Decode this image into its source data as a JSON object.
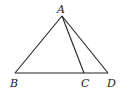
{
  "diagram": {
    "type": "triangle",
    "points": {
      "A": {
        "label": "A",
        "x": 62,
        "y": 16
      },
      "B": {
        "label": "B",
        "x": 15,
        "y": 73
      },
      "C": {
        "label": "C",
        "x": 84,
        "y": 73
      },
      "D": {
        "label": "D",
        "x": 108,
        "y": 73
      }
    },
    "segments": [
      [
        "A",
        "B"
      ],
      [
        "A",
        "C"
      ],
      [
        "A",
        "D"
      ],
      [
        "B",
        "D"
      ]
    ],
    "line_color": "#222222"
  }
}
